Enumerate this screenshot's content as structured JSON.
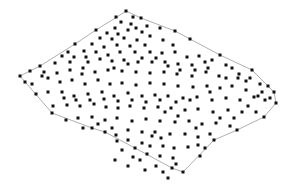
{
  "diagram": {
    "type": "point-cloud-in-polygon",
    "boundary_color": "#9a9a9a",
    "point_color": "#111111",
    "point_size": 3,
    "boundary": [
      [
        126,
        11
      ],
      [
        141,
        18
      ],
      [
        175,
        31
      ],
      [
        220,
        55
      ],
      [
        252,
        70
      ],
      [
        274,
        92
      ],
      [
        276,
        103
      ],
      [
        264,
        117
      ],
      [
        237,
        130
      ],
      [
        214,
        140
      ],
      [
        183,
        172
      ],
      [
        172,
        168
      ],
      [
        135,
        148
      ],
      [
        105,
        132
      ],
      [
        92,
        128
      ],
      [
        52,
        113
      ],
      [
        20,
        76
      ],
      [
        40,
        66
      ],
      [
        75,
        44
      ],
      [
        96,
        30
      ],
      [
        117,
        17
      ]
    ],
    "points": [
      [
        126,
        11
      ],
      [
        116,
        17
      ],
      [
        133,
        17
      ],
      [
        121,
        22
      ],
      [
        131,
        24
      ],
      [
        141,
        18
      ],
      [
        115,
        28
      ],
      [
        128,
        30
      ],
      [
        136,
        28
      ],
      [
        107,
        33
      ],
      [
        118,
        34
      ],
      [
        142,
        32
      ],
      [
        147,
        26
      ],
      [
        100,
        38
      ],
      [
        112,
        39
      ],
      [
        124,
        38
      ],
      [
        137,
        40
      ],
      [
        96,
        30
      ],
      [
        92,
        44
      ],
      [
        104,
        47
      ],
      [
        117,
        45
      ],
      [
        130,
        46
      ],
      [
        145,
        45
      ],
      [
        150,
        36
      ],
      [
        160,
        28
      ],
      [
        175,
        31
      ],
      [
        163,
        40
      ],
      [
        173,
        45
      ],
      [
        84,
        51
      ],
      [
        96,
        52
      ],
      [
        108,
        55
      ],
      [
        120,
        52
      ],
      [
        135,
        52
      ],
      [
        150,
        52
      ],
      [
        162,
        53
      ],
      [
        175,
        52
      ],
      [
        190,
        39
      ],
      [
        187,
        57
      ],
      [
        199,
        56
      ],
      [
        75,
        44
      ],
      [
        68,
        52
      ],
      [
        62,
        56
      ],
      [
        74,
        57
      ],
      [
        86,
        57
      ],
      [
        100,
        59
      ],
      [
        112,
        61
      ],
      [
        124,
        60
      ],
      [
        138,
        62
      ],
      [
        152,
        62
      ],
      [
        165,
        62
      ],
      [
        178,
        64
      ],
      [
        192,
        65
      ],
      [
        205,
        62
      ],
      [
        220,
        55
      ],
      [
        212,
        60
      ],
      [
        226,
        65
      ],
      [
        55,
        63
      ],
      [
        44,
        72
      ],
      [
        57,
        73
      ],
      [
        70,
        70
      ],
      [
        83,
        68
      ],
      [
        95,
        72
      ],
      [
        108,
        70
      ],
      [
        122,
        71
      ],
      [
        136,
        72
      ],
      [
        150,
        73
      ],
      [
        164,
        72
      ],
      [
        177,
        74
      ],
      [
        192,
        76
      ],
      [
        206,
        72
      ],
      [
        219,
        76
      ],
      [
        232,
        68
      ],
      [
        239,
        74
      ],
      [
        252,
        70
      ],
      [
        20,
        76
      ],
      [
        25,
        82
      ],
      [
        32,
        84
      ],
      [
        30,
        71
      ],
      [
        40,
        66
      ],
      [
        42,
        76
      ],
      [
        48,
        78
      ],
      [
        60,
        82
      ],
      [
        72,
        80
      ],
      [
        85,
        84
      ],
      [
        98,
        80
      ],
      [
        110,
        84
      ],
      [
        122,
        83
      ],
      [
        136,
        85
      ],
      [
        150,
        83
      ],
      [
        164,
        84
      ],
      [
        178,
        86
      ],
      [
        193,
        87
      ],
      [
        207,
        86
      ],
      [
        220,
        88
      ],
      [
        232,
        86
      ],
      [
        246,
        81
      ],
      [
        260,
        84
      ],
      [
        268,
        86
      ],
      [
        274,
        92
      ],
      [
        36,
        94
      ],
      [
        48,
        92
      ],
      [
        62,
        92
      ],
      [
        74,
        96
      ],
      [
        88,
        94
      ],
      [
        102,
        92
      ],
      [
        114,
        96
      ],
      [
        128,
        93
      ],
      [
        142,
        96
      ],
      [
        155,
        95
      ],
      [
        168,
        96
      ],
      [
        183,
        98
      ],
      [
        197,
        97
      ],
      [
        212,
        100
      ],
      [
        226,
        98
      ],
      [
        240,
        100
      ],
      [
        254,
        97
      ],
      [
        265,
        100
      ],
      [
        276,
        103
      ],
      [
        53,
        106
      ],
      [
        67,
        105
      ],
      [
        80,
        106
      ],
      [
        94,
        104
      ],
      [
        106,
        107
      ],
      [
        118,
        108
      ],
      [
        130,
        106
      ],
      [
        144,
        108
      ],
      [
        158,
        107
      ],
      [
        171,
        108
      ],
      [
        185,
        110
      ],
      [
        198,
        109
      ],
      [
        213,
        112
      ],
      [
        228,
        110
      ],
      [
        242,
        112
      ],
      [
        256,
        112
      ],
      [
        264,
        117
      ],
      [
        52,
        113
      ],
      [
        66,
        120
      ],
      [
        78,
        118
      ],
      [
        92,
        117
      ],
      [
        105,
        120
      ],
      [
        117,
        118
      ],
      [
        132,
        121
      ],
      [
        146,
        119
      ],
      [
        160,
        121
      ],
      [
        175,
        122
      ],
      [
        189,
        121
      ],
      [
        202,
        124
      ],
      [
        216,
        123
      ],
      [
        230,
        126
      ],
      [
        237,
        130
      ],
      [
        83,
        128
      ],
      [
        92,
        128
      ],
      [
        98,
        124
      ],
      [
        112,
        128
      ],
      [
        116,
        135
      ],
      [
        128,
        130
      ],
      [
        142,
        132
      ],
      [
        155,
        132
      ],
      [
        161,
        138
      ],
      [
        170,
        134
      ],
      [
        185,
        134
      ],
      [
        198,
        137
      ],
      [
        210,
        134
      ],
      [
        214,
        140
      ],
      [
        105,
        132
      ],
      [
        117,
        141
      ],
      [
        128,
        140
      ],
      [
        142,
        143
      ],
      [
        150,
        146
      ],
      [
        163,
        146
      ],
      [
        174,
        148
      ],
      [
        188,
        147
      ],
      [
        198,
        145
      ],
      [
        135,
        148
      ],
      [
        147,
        154
      ],
      [
        160,
        156
      ],
      [
        173,
        158
      ],
      [
        176,
        164
      ],
      [
        172,
        168
      ],
      [
        183,
        172
      ],
      [
        200,
        156
      ],
      [
        205,
        148
      ],
      [
        165,
        112
      ],
      [
        178,
        116
      ],
      [
        152,
        136
      ],
      [
        122,
        150
      ],
      [
        133,
        157
      ],
      [
        140,
        160
      ],
      [
        156,
        166
      ],
      [
        163,
        172
      ],
      [
        168,
        178
      ],
      [
        115,
        160
      ],
      [
        128,
        166
      ],
      [
        145,
        170
      ],
      [
        196,
        128
      ],
      [
        220,
        118
      ],
      [
        234,
        118
      ],
      [
        248,
        106
      ],
      [
        258,
        96
      ],
      [
        246,
        90
      ],
      [
        210,
        92
      ],
      [
        190,
        100
      ],
      [
        176,
        102
      ],
      [
        160,
        100
      ],
      [
        146,
        102
      ],
      [
        132,
        100
      ],
      [
        118,
        101
      ],
      [
        104,
        99
      ],
      [
        90,
        100
      ],
      [
        76,
        100
      ],
      [
        64,
        98
      ],
      [
        82,
        74
      ],
      [
        70,
        62
      ],
      [
        88,
        62
      ],
      [
        114,
        68
      ],
      [
        128,
        64
      ],
      [
        142,
        58
      ],
      [
        156,
        58
      ],
      [
        168,
        66
      ],
      [
        180,
        70
      ],
      [
        195,
        70
      ],
      [
        208,
        68
      ],
      [
        226,
        78
      ],
      [
        238,
        78
      ],
      [
        250,
        78
      ],
      [
        262,
        92
      ],
      [
        270,
        98
      ]
    ]
  }
}
